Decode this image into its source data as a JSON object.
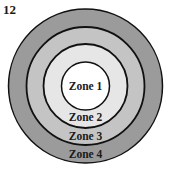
{
  "figure": {
    "number": "12"
  },
  "zones": [
    {
      "label": "Zone 1",
      "color": "#ffffff",
      "radius": 24,
      "label_y": 90
    },
    {
      "label": "Zone 2",
      "color": "#e6e6e6",
      "radius": 42,
      "label_y": 121
    },
    {
      "label": "Zone 3",
      "color": "#c4c4c4",
      "radius": 59,
      "label_y": 140
    },
    {
      "label": "Zone 4",
      "color": "#9b9b9b",
      "radius": 77,
      "label_y": 158
    }
  ],
  "center": {
    "x": 85.5,
    "y": 86
  },
  "stroke_color": "#111111"
}
